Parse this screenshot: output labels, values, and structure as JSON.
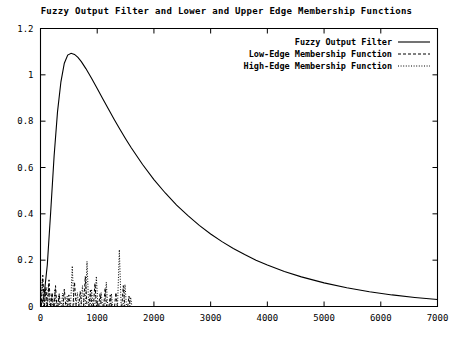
{
  "chart_data": {
    "type": "line",
    "title": "Fuzzy Output Filter and Lower and Upper Edge Membership Functions",
    "xlabel": "",
    "ylabel": "",
    "xlim": [
      0,
      7000
    ],
    "ylim": [
      0,
      1.2
    ],
    "grid": false,
    "legend_position": "top-right",
    "xticks": [
      0,
      1000,
      2000,
      3000,
      4000,
      5000,
      6000,
      7000
    ],
    "xtick_labels": [
      "0",
      "1000",
      "2000",
      "3000",
      "4000",
      "5000",
      "6000",
      "7000"
    ],
    "yticks": [
      0,
      0.2,
      0.4,
      0.6,
      0.8,
      1,
      1.2
    ],
    "ytick_labels": [
      "0",
      "0.2",
      "0.4",
      "0.6",
      "0.8",
      "1",
      "1.2"
    ],
    "series": [
      {
        "name": "Fuzzy Output Filter",
        "style": "solid",
        "color": "#000000",
        "x": [
          0,
          60,
          120,
          180,
          240,
          300,
          360,
          420,
          480,
          540,
          600,
          660,
          720,
          800,
          900,
          1000,
          1100,
          1200,
          1300,
          1400,
          1500,
          1600,
          1800,
          2000,
          2200,
          2400,
          2600,
          2800,
          3000,
          3200,
          3400,
          3600,
          3800,
          4000,
          4300,
          4600,
          5000,
          5400,
          5800,
          6200,
          6600,
          7000
        ],
        "y": [
          0.0,
          0.04,
          0.18,
          0.41,
          0.65,
          0.84,
          0.97,
          1.05,
          1.085,
          1.093,
          1.088,
          1.075,
          1.057,
          1.027,
          0.985,
          0.941,
          0.896,
          0.851,
          0.807,
          0.765,
          0.724,
          0.685,
          0.613,
          0.548,
          0.49,
          0.438,
          0.392,
          0.35,
          0.313,
          0.28,
          0.25,
          0.224,
          0.2,
          0.179,
          0.151,
          0.128,
          0.102,
          0.081,
          0.064,
          0.05,
          0.039,
          0.03
        ]
      },
      {
        "name": "Low-Edge Membership Function",
        "style": "dashed",
        "color": "#000000",
        "spikes": [
          {
            "center": 40,
            "height": 0.135,
            "halfwidth": 28
          },
          {
            "center": 95,
            "height": 0.085,
            "halfwidth": 24
          },
          {
            "center": 150,
            "height": 0.115,
            "halfwidth": 26
          },
          {
            "center": 205,
            "height": 0.06,
            "halfwidth": 22
          },
          {
            "center": 265,
            "height": 0.09,
            "halfwidth": 24
          },
          {
            "center": 330,
            "height": 0.055,
            "halfwidth": 22
          },
          {
            "center": 420,
            "height": 0.075,
            "halfwidth": 26
          },
          {
            "center": 500,
            "height": 0.05,
            "halfwidth": 22
          },
          {
            "center": 600,
            "height": 0.105,
            "halfwidth": 28
          },
          {
            "center": 700,
            "height": 0.065,
            "halfwidth": 24
          },
          {
            "center": 790,
            "height": 0.13,
            "halfwidth": 30
          },
          {
            "center": 880,
            "height": 0.07,
            "halfwidth": 26
          },
          {
            "center": 960,
            "height": 0.1,
            "halfwidth": 28
          },
          {
            "center": 1050,
            "height": 0.055,
            "halfwidth": 24
          },
          {
            "center": 1140,
            "height": 0.08,
            "halfwidth": 26
          },
          {
            "center": 1230,
            "height": 0.05,
            "halfwidth": 22
          },
          {
            "center": 1330,
            "height": 0.06,
            "halfwidth": 24
          },
          {
            "center": 1460,
            "height": 0.09,
            "halfwidth": 26
          },
          {
            "center": 1560,
            "height": 0.045,
            "halfwidth": 22
          }
        ]
      },
      {
        "name": "High-Edge Membership Function",
        "style": "dotted",
        "color": "#000000",
        "spikes": [
          {
            "center": 30,
            "height": 0.115,
            "halfwidth": 26
          },
          {
            "center": 85,
            "height": 0.07,
            "halfwidth": 22
          },
          {
            "center": 140,
            "height": 0.095,
            "halfwidth": 24
          },
          {
            "center": 200,
            "height": 0.05,
            "halfwidth": 22
          },
          {
            "center": 255,
            "height": 0.075,
            "halfwidth": 22
          },
          {
            "center": 320,
            "height": 0.045,
            "halfwidth": 20
          },
          {
            "center": 390,
            "height": 0.058,
            "halfwidth": 22
          },
          {
            "center": 470,
            "height": 0.045,
            "halfwidth": 20
          },
          {
            "center": 560,
            "height": 0.175,
            "halfwidth": 30
          },
          {
            "center": 650,
            "height": 0.06,
            "halfwidth": 24
          },
          {
            "center": 740,
            "height": 0.09,
            "halfwidth": 26
          },
          {
            "center": 820,
            "height": 0.195,
            "halfwidth": 30
          },
          {
            "center": 900,
            "height": 0.075,
            "halfwidth": 26
          },
          {
            "center": 985,
            "height": 0.13,
            "halfwidth": 28
          },
          {
            "center": 1070,
            "height": 0.06,
            "halfwidth": 24
          },
          {
            "center": 1160,
            "height": 0.105,
            "halfwidth": 26
          },
          {
            "center": 1250,
            "height": 0.055,
            "halfwidth": 22
          },
          {
            "center": 1390,
            "height": 0.245,
            "halfwidth": 32
          },
          {
            "center": 1490,
            "height": 0.095,
            "halfwidth": 26
          },
          {
            "center": 1590,
            "height": 0.04,
            "halfwidth": 22
          }
        ]
      }
    ]
  },
  "legend": {
    "entries": [
      {
        "label": "Fuzzy Output Filter",
        "style": "solid"
      },
      {
        "label": "Low-Edge Membership Function",
        "style": "dashed"
      },
      {
        "label": "High-Edge Membership Function",
        "style": "dotted"
      }
    ]
  }
}
